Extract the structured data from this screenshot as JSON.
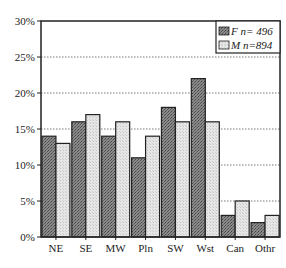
{
  "chart_data": {
    "type": "bar",
    "title": "",
    "xlabel": "",
    "ylabel": "",
    "categories": [
      "NE",
      "SE",
      "MW",
      "Pln",
      "SW",
      "Wst",
      "Can",
      "Othr"
    ],
    "series": [
      {
        "name": "F n= 496",
        "values": [
          14,
          16,
          14,
          11,
          18,
          22,
          3,
          2
        ],
        "fill": "#7a7a7a",
        "pattern": "dark-dotted"
      },
      {
        "name": "M n=894",
        "values": [
          13,
          17,
          16,
          14,
          16,
          16,
          5,
          3
        ],
        "fill": "#e0e0e0",
        "pattern": "light-dotted"
      }
    ],
    "ylim": [
      0,
      30
    ],
    "yticks": [
      "0%",
      "5%",
      "10%",
      "15%",
      "20%",
      "25%",
      "30%"
    ],
    "ytick_values": [
      0,
      5,
      10,
      15,
      20,
      25,
      30
    ],
    "grid": "horizontal-dotted",
    "legend_position": "top-right-inside"
  },
  "legend": {
    "f_label": "F n= 496",
    "m_label": "M n=894"
  }
}
